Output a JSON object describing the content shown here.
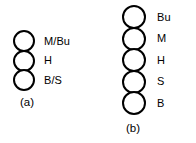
{
  "figure": {
    "background_color": "#ffffff",
    "line_color": "#000000",
    "panels": [
      {
        "id": "a",
        "caption": "(a)",
        "bead_count": 3,
        "beads": [
          {
            "label": "M/Bu"
          },
          {
            "label": "H"
          },
          {
            "label": "B/S"
          }
        ]
      },
      {
        "id": "b",
        "caption": "(b)",
        "bead_count": 5,
        "beads": [
          {
            "label": "Bu"
          },
          {
            "label": "M"
          },
          {
            "label": "H"
          },
          {
            "label": "S"
          },
          {
            "label": "B"
          }
        ]
      }
    ]
  }
}
